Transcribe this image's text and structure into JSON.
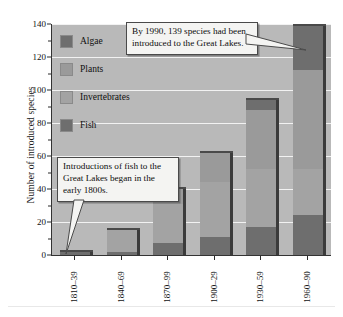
{
  "chart_data": {
    "type": "bar",
    "subtype": "stacked",
    "title": "",
    "xlabel": "",
    "ylabel": "Number of introduced species",
    "ylim": [
      0,
      140
    ],
    "yticks": [
      0,
      20,
      40,
      60,
      80,
      100,
      120,
      140
    ],
    "ytick_labels": [
      "0",
      "20",
      "40",
      "60",
      "80",
      "100",
      "120",
      "140"
    ],
    "grid": true,
    "legend_position": "upper-left-inside",
    "categories": [
      "1810–39",
      "1840–69",
      "1870–99",
      "1900–29",
      "1930–59",
      "1960–90"
    ],
    "series": [
      {
        "name": "Fish",
        "color": "#6e6e6e",
        "values": [
          2,
          2,
          7,
          11,
          17,
          24
        ]
      },
      {
        "name": "Invertebrates",
        "color": "#a3a3a3",
        "values": [
          0,
          13,
          24,
          33,
          35,
          28
        ]
      },
      {
        "name": "Plants",
        "color": "#9a9a9a",
        "values": [
          0,
          0,
          9,
          18,
          36,
          60
        ]
      },
      {
        "name": "Algae",
        "color": "#6e6e6e",
        "values": [
          0,
          0,
          0,
          0,
          6,
          27
        ]
      }
    ],
    "totals": [
      2,
      15,
      40,
      62,
      94,
      139
    ],
    "annotations": [
      {
        "id": "callout-1990",
        "text": "By 1990, 139 species had been introduced to the Great Lakes.",
        "points_to": "1960–90"
      },
      {
        "id": "callout-fish",
        "text": "Introductions of fish to the Great Lakes began in the early 1800s.",
        "points_to": "1810–39"
      }
    ]
  },
  "legend": {
    "items": [
      {
        "label": "Algae",
        "color": "#6e6e6e"
      },
      {
        "label": "Plants",
        "color": "#9a9a9a"
      },
      {
        "label": "Invertebrates",
        "color": "#a3a3a3"
      },
      {
        "label": "Fish",
        "color": "#6e6e6e"
      }
    ]
  },
  "annotations": {
    "total_1990": "By 1990, 139 species had been introduced to the Great Lakes.",
    "fish_start": "Introductions of fish to the Great Lakes began in the early 1800s."
  },
  "axes": {
    "y_title": "Number of introduced species",
    "y_labels": [
      "140",
      "120",
      "100",
      "80",
      "60",
      "40",
      "20",
      "0"
    ],
    "x_labels": [
      "1810–39",
      "1840–69",
      "1870–99",
      "1900–29",
      "1930–59",
      "1960–90"
    ]
  },
  "colors": {
    "plot_background": "#b9b9b9",
    "gridline": "#f2f2f2",
    "axis": "#333333",
    "bar_shadow": "#3b3b3b",
    "callout_background": "#f4f4f2",
    "callout_border": "#4a4a4a"
  }
}
